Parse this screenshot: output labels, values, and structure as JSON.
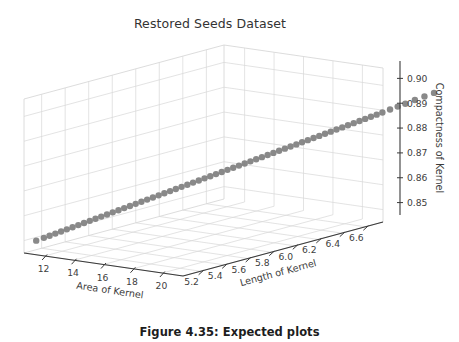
{
  "figure": {
    "caption": "Figure 4.35: Expected plots"
  },
  "chart_data": {
    "type": "scatter",
    "projection": "3d",
    "title": "Restored Seeds Dataset",
    "xlabel": "Area of Kernel",
    "ylabel": "Length of Kernel",
    "zlabel": "Compactness of Kernel",
    "xticks": [
      "12",
      "14",
      "16",
      "18",
      "20"
    ],
    "xtick_values": [
      12,
      14,
      16,
      18,
      20
    ],
    "yticks": [
      "5.2",
      "5.4",
      "5.6",
      "5.8",
      "6.0",
      "6.2",
      "6.4",
      "6.6"
    ],
    "ytick_values": [
      5.2,
      5.4,
      5.6,
      5.8,
      6.0,
      6.2,
      6.4,
      6.6
    ],
    "zticks": [
      "0.85",
      "0.86",
      "0.87",
      "0.88",
      "0.89",
      "0.90"
    ],
    "ztick_values": [
      0.85,
      0.86,
      0.87,
      0.88,
      0.89,
      0.9
    ],
    "xlim": [
      10.6,
      21.4
    ],
    "ylim": [
      5.05,
      6.75
    ],
    "zlim": [
      0.845,
      0.907
    ],
    "grid": true,
    "legend": false,
    "marker_color": "#7f7f7f",
    "marker_size": 3.2,
    "pane_color": "#ffffff",
    "grid_color": "#d8d8d8",
    "axis_line_color": "#3a3a3a",
    "series": [
      {
        "name": "seeds",
        "points": [
          [
            10.95,
            5.11,
            0.8495
          ],
          [
            11.15,
            5.15,
            0.8503
          ],
          [
            11.3,
            5.18,
            0.8509
          ],
          [
            11.45,
            5.21,
            0.8515
          ],
          [
            11.6,
            5.24,
            0.8521
          ],
          [
            11.75,
            5.27,
            0.8527
          ],
          [
            11.9,
            5.3,
            0.8533
          ],
          [
            12.05,
            5.33,
            0.8539
          ],
          [
            12.2,
            5.36,
            0.8545
          ],
          [
            12.35,
            5.39,
            0.8551
          ],
          [
            12.5,
            5.42,
            0.8557
          ],
          [
            12.65,
            5.45,
            0.8563
          ],
          [
            12.8,
            5.48,
            0.8569
          ],
          [
            12.95,
            5.51,
            0.8575
          ],
          [
            13.1,
            5.54,
            0.8581
          ],
          [
            13.25,
            5.57,
            0.8587
          ],
          [
            13.4,
            5.6,
            0.8593
          ],
          [
            13.55,
            5.63,
            0.8599
          ],
          [
            13.7,
            5.66,
            0.8605
          ],
          [
            13.85,
            5.69,
            0.8611
          ],
          [
            14.0,
            5.72,
            0.8617
          ],
          [
            14.15,
            5.75,
            0.8623
          ],
          [
            14.3,
            5.78,
            0.8629
          ],
          [
            14.45,
            5.81,
            0.8635
          ],
          [
            14.6,
            5.84,
            0.8641
          ],
          [
            14.75,
            5.87,
            0.8647
          ],
          [
            14.9,
            5.9,
            0.8653
          ],
          [
            15.05,
            5.93,
            0.8659
          ],
          [
            15.2,
            5.96,
            0.8665
          ],
          [
            15.35,
            5.99,
            0.8671
          ],
          [
            15.5,
            6.02,
            0.8677
          ],
          [
            15.65,
            6.05,
            0.8683
          ],
          [
            15.8,
            6.08,
            0.8689
          ],
          [
            15.95,
            6.11,
            0.8695
          ],
          [
            16.1,
            6.14,
            0.8701
          ],
          [
            16.25,
            6.17,
            0.8707
          ],
          [
            16.4,
            6.2,
            0.8713
          ],
          [
            16.55,
            6.23,
            0.8719
          ],
          [
            16.7,
            6.26,
            0.8725
          ],
          [
            16.85,
            6.29,
            0.8731
          ],
          [
            17.0,
            6.32,
            0.8737
          ],
          [
            17.15,
            6.35,
            0.8743
          ],
          [
            17.3,
            6.38,
            0.8749
          ],
          [
            17.45,
            6.41,
            0.8755
          ],
          [
            17.6,
            6.44,
            0.8761
          ],
          [
            17.75,
            6.47,
            0.8767
          ],
          [
            17.9,
            6.5,
            0.8773
          ],
          [
            18.05,
            6.53,
            0.8779
          ],
          [
            18.2,
            6.56,
            0.8785
          ],
          [
            18.35,
            6.59,
            0.8791
          ],
          [
            18.5,
            6.62,
            0.8797
          ],
          [
            18.65,
            6.65,
            0.8803
          ],
          [
            18.8,
            6.68,
            0.8809
          ],
          [
            18.95,
            6.71,
            0.8815
          ],
          [
            19.1,
            6.74,
            0.8821
          ],
          [
            19.25,
            6.77,
            0.8827
          ],
          [
            19.4,
            6.8,
            0.8833
          ],
          [
            19.55,
            6.83,
            0.8839
          ],
          [
            19.7,
            6.86,
            0.8845
          ],
          [
            19.85,
            6.89,
            0.8851
          ],
          [
            20.0,
            6.92,
            0.8857
          ],
          [
            20.2,
            6.96,
            0.8866
          ],
          [
            20.4,
            7.0,
            0.8874
          ],
          [
            20.6,
            7.04,
            0.8882
          ],
          [
            20.85,
            7.09,
            0.8893
          ],
          [
            21.1,
            7.14,
            0.8903
          ],
          [
            21.35,
            7.19,
            0.8913
          ]
        ]
      }
    ]
  }
}
